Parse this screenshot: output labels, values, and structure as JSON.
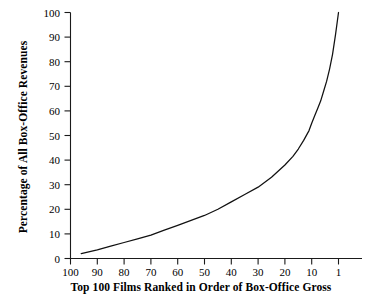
{
  "chart_data": {
    "type": "line",
    "title": "",
    "xlabel": "Top 100 Films Ranked in Order of Box-Office Gross",
    "ylabel": "Percentage of All Box-Office Revenues",
    "xlim": [
      100,
      0
    ],
    "ylim": [
      0,
      100
    ],
    "x_axis_inverted": true,
    "grid": false,
    "legend": null,
    "xticks": [
      100,
      90,
      80,
      70,
      60,
      50,
      40,
      30,
      20,
      10,
      1
    ],
    "xtick_labels": [
      "100",
      "90",
      "80",
      "70",
      "60",
      "50",
      "40",
      "30",
      "20",
      "10",
      "1"
    ],
    "yticks": [
      0,
      10,
      20,
      30,
      40,
      50,
      60,
      70,
      80,
      90,
      100
    ],
    "ytick_labels": [
      "0",
      "10",
      "20",
      "30",
      "40",
      "50",
      "60",
      "70",
      "80",
      "90",
      "100"
    ],
    "series": [
      {
        "name": "Cumulative percentage of all box-office revenues",
        "x": [
          96,
          90,
          85,
          80,
          75,
          70,
          65,
          60,
          55,
          50,
          45,
          40,
          35,
          30,
          25,
          20,
          17,
          15,
          13,
          11,
          10,
          9,
          8,
          7,
          6,
          5,
          4,
          3,
          2,
          1
        ],
        "values": [
          2,
          3.5,
          5,
          6.5,
          8,
          9.5,
          11.5,
          13.5,
          15.5,
          17.5,
          20,
          23,
          26,
          29,
          33,
          38,
          41.5,
          44.5,
          48,
          52,
          55,
          58,
          61,
          64,
          68,
          72,
          77,
          83,
          91,
          100
        ]
      }
    ]
  },
  "axis": {
    "y_title": "Percentage of All Box-Office Revenues",
    "x_title": "Top 100 Films Ranked in Order of Box-Office Gross"
  }
}
